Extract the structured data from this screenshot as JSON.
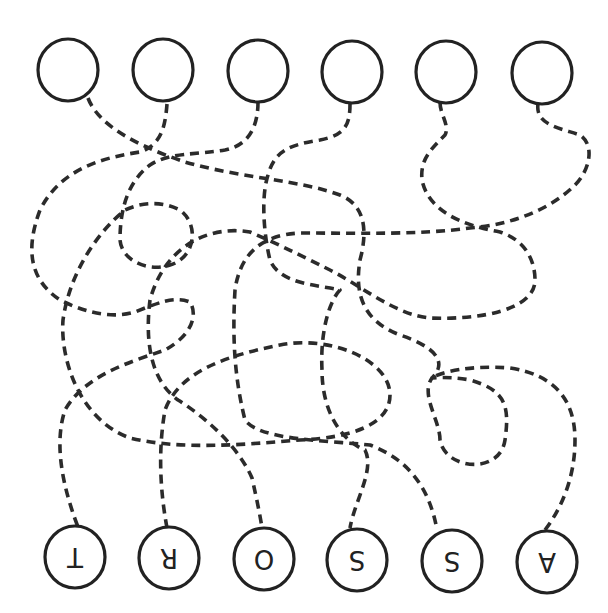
{
  "puzzle": {
    "type": "tangled-lines-matching",
    "stroke_color": "#2b2b2b",
    "circle_color": "#222222",
    "background": "#ffffff",
    "top_circles": [
      {
        "id": "top-1",
        "cx": 68,
        "cy": 70,
        "r": 30,
        "label": ""
      },
      {
        "id": "top-2",
        "cx": 163,
        "cy": 70,
        "r": 30,
        "label": ""
      },
      {
        "id": "top-3",
        "cx": 258,
        "cy": 71,
        "r": 30,
        "label": ""
      },
      {
        "id": "top-4",
        "cx": 352,
        "cy": 72,
        "r": 30,
        "label": ""
      },
      {
        "id": "top-5",
        "cx": 446,
        "cy": 72,
        "r": 30,
        "label": ""
      },
      {
        "id": "top-6",
        "cx": 542,
        "cy": 73,
        "r": 30,
        "label": ""
      }
    ],
    "bottom_circles": [
      {
        "id": "bottom-1",
        "cx": 75,
        "cy": 557,
        "r": 30,
        "label": "T",
        "rotated": true
      },
      {
        "id": "bottom-2",
        "cx": 169,
        "cy": 558,
        "r": 30,
        "label": "R",
        "rotated": true
      },
      {
        "id": "bottom-3",
        "cx": 264,
        "cy": 559,
        "r": 30,
        "label": "O",
        "rotated": true
      },
      {
        "id": "bottom-4",
        "cx": 357,
        "cy": 560,
        "r": 30,
        "label": "S",
        "rotated": true
      },
      {
        "id": "bottom-5",
        "cx": 452,
        "cy": 561,
        "r": 30,
        "label": "S",
        "rotated": true
      },
      {
        "id": "bottom-6",
        "cx": 547,
        "cy": 562,
        "r": 30,
        "label": "A",
        "rotated": true
      }
    ],
    "paths": [
      {
        "id": "path-a",
        "d": "M 88 98 C 100 130, 150 150, 185 162 C 240 178, 300 180, 340 195 C 365 205, 368 230, 360 260 C 355 290, 360 320, 400 335 C 430 345, 450 360, 432 378 C 420 395, 440 420, 440 440 C 445 470, 500 475, 505 440 C 510 405, 505 390, 470 380 C 450 376, 430 378, 432 378"
      },
      {
        "id": "path-b",
        "d": "M 167 104 C 165 130, 160 145, 140 152 C 100 158, 60 170, 40 210 C 25 250, 30 280, 60 300 C 90 315, 115 318, 135 312 C 160 302, 175 296, 190 302 C 198 315, 192 335, 165 350 C 130 362, 85 375, 65 410 C 55 440, 60 480, 78 527"
      },
      {
        "id": "path-c",
        "d": "M 258 102 C 258 125, 250 145, 225 150 C 195 155, 170 152, 150 165 C 130 180, 120 205, 120 240 C 122 262, 150 272, 170 265 C 195 258, 200 225, 180 210 C 160 200, 140 203, 125 210 C 100 230, 70 270, 63 320 C 60 360, 80 420, 130 438 C 180 450, 240 445, 300 440 C 350 438, 390 425, 390 395 C 390 360, 330 335, 280 345 C 230 355, 180 370, 165 410 C 158 450, 160 490, 167 528"
      },
      {
        "id": "path-d",
        "d": "M 350 104 C 350 125, 345 135, 320 140 C 290 145, 275 150, 268 175 C 260 200, 265 240, 270 260 C 280 285, 320 285, 340 290 C 330 300, 320 330, 322 370 C 322 410, 340 440, 365 450 C 375 470, 355 500, 350 528"
      },
      {
        "id": "path-e",
        "d": "M 440 102 C 440 115, 450 125, 445 135 C 430 150, 420 160, 422 180 C 428 210, 460 225, 500 232 C 525 240, 535 260, 535 280 C 535 310, 480 320, 430 318 C 395 315, 360 285, 330 270 C 300 255, 280 245, 250 232 C 210 225, 165 245, 150 300 C 145 340, 150 380, 178 400 C 210 420, 240 450, 252 478 C 257 500, 260 515, 262 528"
      },
      {
        "id": "path-f",
        "d": "M 538 104 C 535 125, 560 128, 580 135 C 595 145, 590 170, 575 185 C 550 210, 510 225, 470 228 C 420 235, 360 233, 300 233 C 260 235, 240 255, 235 290 C 232 340, 235 380, 245 420 C 260 440, 320 440, 370 445 C 410 460, 430 490, 437 530"
      },
      {
        "id": "path-g",
        "d": "M 545 530 C 560 510, 575 480, 575 440 C 575 400, 555 375, 510 368 C 470 365, 440 372, 432 378"
      }
    ]
  }
}
